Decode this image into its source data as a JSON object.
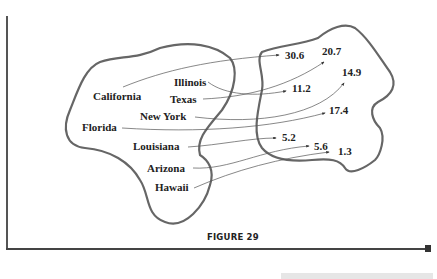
{
  "figure": {
    "caption": "FIGURE 29",
    "type": "mapping diagram",
    "domain_labels": [
      {
        "id": "california",
        "label": "California",
        "maps_to": "30.6"
      },
      {
        "id": "illinois",
        "label": "Illinois",
        "maps_to": "11.2"
      },
      {
        "id": "texas",
        "label": "Texas",
        "maps_to": "20.7"
      },
      {
        "id": "new-york",
        "label": "New York",
        "maps_to": "14.9"
      },
      {
        "id": "florida",
        "label": "Florida",
        "maps_to": "17.4"
      },
      {
        "id": "louisiana",
        "label": "Louisiana",
        "maps_to": "5.2"
      },
      {
        "id": "arizona",
        "label": "Arizona",
        "maps_to": "5.6"
      },
      {
        "id": "hawaii",
        "label": "Hawaii",
        "maps_to": "1.3"
      }
    ],
    "range_values": [
      "30.6",
      "20.7",
      "14.9",
      "11.2",
      "17.4",
      "5.2",
      "5.6",
      "1.3"
    ],
    "colors": {
      "outline": "#666666",
      "arrow": "#555555",
      "text": "#222222"
    }
  }
}
